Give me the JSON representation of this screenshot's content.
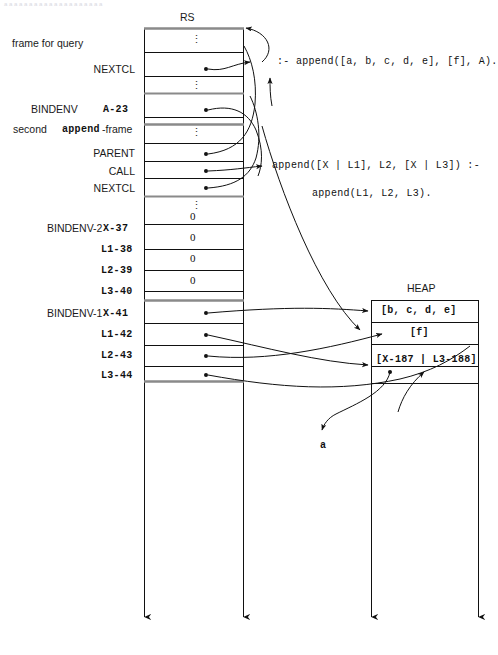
{
  "figure": {
    "top_strip_text": "a a a a a a a a a a a a a a a a a a a a",
    "rs_title": "RS",
    "heap_title": "HEAP"
  },
  "rs": {
    "rows": [
      {
        "left_label": "frame for query",
        "left_label_bold": "",
        "name": "",
        "value": "⋮",
        "kind": "ellipsis"
      },
      {
        "left_label": "",
        "left_label_bold": "",
        "name": "NEXTCL",
        "value": "",
        "kind": "pointer"
      },
      {
        "left_label": "",
        "left_label_bold": "",
        "name": "",
        "value": "⋮",
        "kind": "ellipsis"
      },
      {
        "left_label": "BINDENV",
        "left_label_bold": "A-23",
        "name": "",
        "value": "",
        "kind": "pointer"
      },
      {
        "left_label": "second ",
        "left_label_bold": "append",
        "left_label_tail": "-frame",
        "name": "",
        "value": "⋮",
        "kind": "ellipsis"
      },
      {
        "left_label": "",
        "left_label_bold": "",
        "name": "PARENT",
        "value": "",
        "kind": "pointer"
      },
      {
        "left_label": "",
        "left_label_bold": "",
        "name": "CALL",
        "value": "",
        "kind": "pointer"
      },
      {
        "left_label": "",
        "left_label_bold": "",
        "name": "NEXTCL",
        "value": "",
        "kind": "pointer"
      },
      {
        "left_label": "",
        "left_label_bold": "",
        "name": "",
        "value": "⋮",
        "kind": "ellipsis"
      },
      {
        "left_label": "BINDENV-2",
        "left_label_bold": "X-37",
        "name": "",
        "value": "0",
        "kind": "value"
      },
      {
        "left_label": "",
        "left_label_bold": "L1-38",
        "name": "",
        "value": "0",
        "kind": "value"
      },
      {
        "left_label": "",
        "left_label_bold": "L2-39",
        "name": "",
        "value": "0",
        "kind": "value"
      },
      {
        "left_label": "",
        "left_label_bold": "L3-40",
        "name": "",
        "value": "0",
        "kind": "value"
      },
      {
        "left_label": "BINDENV-1",
        "left_label_bold": "X-41",
        "name": "",
        "value": "",
        "kind": "pointer"
      },
      {
        "left_label": "",
        "left_label_bold": "L1-42",
        "name": "",
        "value": "",
        "kind": "pointer"
      },
      {
        "left_label": "",
        "left_label_bold": "L2-43",
        "name": "",
        "value": "",
        "kind": "pointer"
      },
      {
        "left_label": "",
        "left_label_bold": "L3-44",
        "name": "",
        "value": "",
        "kind": "pointer"
      }
    ]
  },
  "heap": {
    "rows": [
      {
        "value": "[b, c, d, e]"
      },
      {
        "value": "[f]"
      },
      {
        "value": "[X-187 | L3-188]"
      },
      {
        "value": ""
      }
    ]
  },
  "code": {
    "clause_query": ":- append([a, b, c, d, e], [f], A).",
    "clause_head": "append([X | L1], L2, [X | L3]) :-",
    "clause_body": "append(L1, L2, L3)."
  },
  "annotations": {
    "atom_a": "a"
  },
  "colors": {
    "line": "#111111",
    "rule_thick": "#8a8a8a",
    "text": "#1a1a1a"
  }
}
